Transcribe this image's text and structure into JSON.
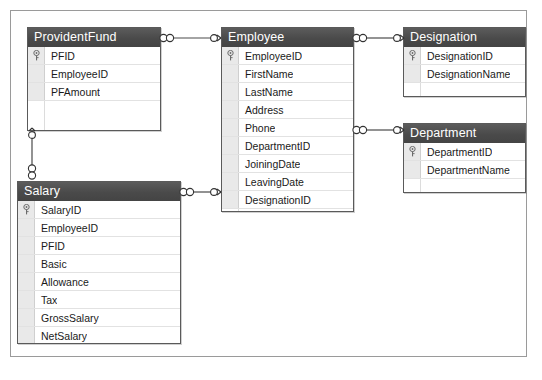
{
  "diagram": {
    "background_color": "#ffffff",
    "canvas_border_color": "#9a9a9a",
    "header_color": "#4a4a4a",
    "header_text_color": "#ffffff",
    "gutter_color": "#e9e9e9",
    "row_separator_color": "#e2e2e2"
  },
  "tables": [
    {
      "name": "ProvidentFund",
      "fields": [
        {
          "name": "PFID",
          "key": true
        },
        {
          "name": "EmployeeID",
          "key": false
        },
        {
          "name": "PFAmount",
          "key": false
        }
      ]
    },
    {
      "name": "Employee",
      "fields": [
        {
          "name": "EmployeeID",
          "key": true
        },
        {
          "name": "FirstName",
          "key": false
        },
        {
          "name": "LastName",
          "key": false
        },
        {
          "name": "Address",
          "key": false
        },
        {
          "name": "Phone",
          "key": false
        },
        {
          "name": "DepartmentID",
          "key": false
        },
        {
          "name": "JoiningDate",
          "key": false
        },
        {
          "name": "LeavingDate",
          "key": false
        },
        {
          "name": "DesignationID",
          "key": false
        }
      ]
    },
    {
      "name": "Designation",
      "fields": [
        {
          "name": "DesignationID",
          "key": true
        },
        {
          "name": "DesignationName",
          "key": false
        }
      ]
    },
    {
      "name": "Department",
      "fields": [
        {
          "name": "DepartmentID",
          "key": true
        },
        {
          "name": "DepartmentName",
          "key": false
        }
      ]
    },
    {
      "name": "Salary",
      "fields": [
        {
          "name": "SalaryID",
          "key": true
        },
        {
          "name": "EmployeeID",
          "key": false
        },
        {
          "name": "PFID",
          "key": false
        },
        {
          "name": "Basic",
          "key": false
        },
        {
          "name": "Allowance",
          "key": false
        },
        {
          "name": "Tax",
          "key": false
        },
        {
          "name": "GrossSalary",
          "key": false
        },
        {
          "name": "NetSalary",
          "key": false
        }
      ]
    }
  ],
  "relationships": [
    {
      "from": "ProvidentFund",
      "to": "Employee",
      "from_cardinality": "many",
      "to_cardinality": "one"
    },
    {
      "from": "Employee",
      "to": "Designation",
      "from_cardinality": "many",
      "to_cardinality": "one"
    },
    {
      "from": "Employee",
      "to": "Department",
      "from_cardinality": "many",
      "to_cardinality": "one"
    },
    {
      "from": "Salary",
      "to": "Employee",
      "from_cardinality": "many",
      "to_cardinality": "one"
    },
    {
      "from": "Salary",
      "to": "ProvidentFund",
      "from_cardinality": "many",
      "to_cardinality": "one"
    }
  ]
}
